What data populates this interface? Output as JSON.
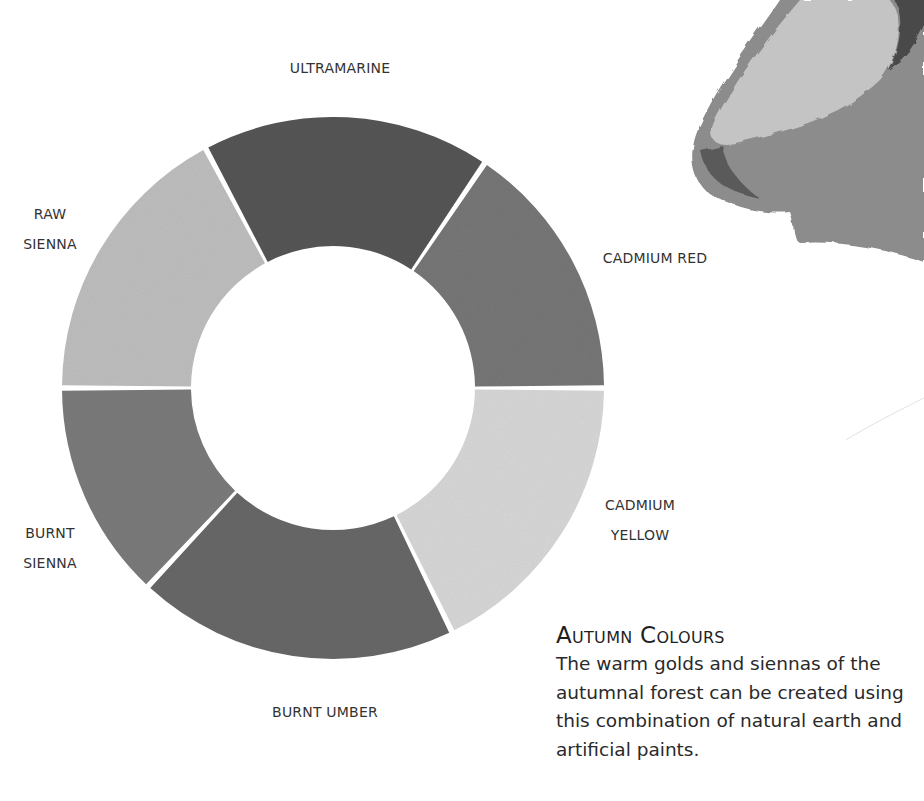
{
  "wheel": {
    "center": [
      333,
      388
    ],
    "outer_radius": 271,
    "inner_radius": 142,
    "segments": [
      {
        "name": "Ultramarine",
        "label": "ULTRAMARINE",
        "start_deg": -118,
        "end_deg": -56,
        "fill": "#555555"
      },
      {
        "name": "Cadmium Red",
        "label": "CADMIUM RED",
        "start_deg": -56,
        "end_deg": 0,
        "fill": "#767676"
      },
      {
        "name": "Cadmium Yellow",
        "label_lines": [
          "CADMIUM",
          "YELLOW"
        ],
        "start_deg": 0,
        "end_deg": 64,
        "fill": "#d6d6d6"
      },
      {
        "name": "Burnt Umber",
        "label": "BURNT UMBER",
        "start_deg": 64,
        "end_deg": 133,
        "fill": "#676767"
      },
      {
        "name": "Burnt Sienna",
        "label_lines": [
          "BURNT",
          "SIENNA"
        ],
        "start_deg": 133,
        "end_deg": 180,
        "fill": "#7a7a7a"
      },
      {
        "name": "Raw Sienna",
        "label_lines": [
          "RAW",
          "SIENNA"
        ],
        "start_deg": 180,
        "end_deg": 242,
        "fill": "#bdbdbd"
      }
    ]
  },
  "labels": {
    "ultramarine": "ULTRAMARINE",
    "cadmium_red": "CADMIUM RED",
    "cadmium_yellow_1": "CADMIUM",
    "cadmium_yellow_2": "YELLOW",
    "burnt_umber": "BURNT UMBER",
    "burnt_sienna_1": "BURNT",
    "burnt_sienna_2": "SIENNA",
    "raw_sienna_1": "RAW",
    "raw_sienna_2": "SIENNA"
  },
  "caption": {
    "title": "Autumn Colours",
    "body": "The warm golds and siennas of the autumnal forest can be created using this combination of natural earth and artificial paints.",
    "body_lines": [
      "The warm golds and siennas of the",
      "autumnal forest can be created using",
      "this combination of natural earth and",
      "artificial paints."
    ]
  },
  "illustration": {
    "description": "watercolour wash sample (leaf/shell shape) cropped at top-right",
    "colors": [
      "#bfbfbf",
      "#8a8a8a",
      "#555555"
    ]
  }
}
